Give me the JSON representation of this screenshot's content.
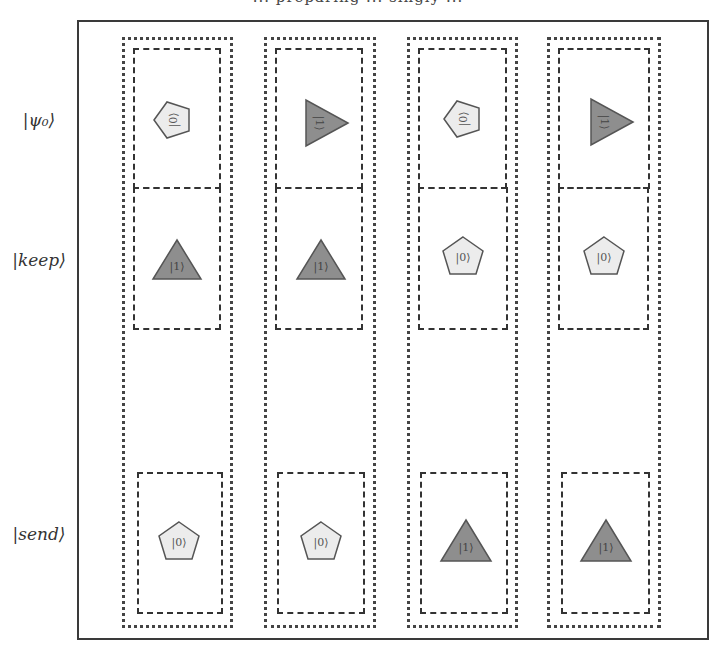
{
  "title": "... preparing ... singly ...",
  "row_labels": {
    "psi0": "|ψ₀⟩",
    "keep": "|keep⟩",
    "send": "|send⟩"
  },
  "colors": {
    "light_fill": "#ececec",
    "dark_fill": "#8e8e8e",
    "stroke": "#555555",
    "frame": "#3a3a3a"
  },
  "columns": [
    {
      "index": 1,
      "psi0": {
        "shape": "pentagon",
        "label": "|0⟩",
        "rotated": true
      },
      "keep": {
        "shape": "triangle",
        "label": "|1⟩",
        "rotated": false
      },
      "send": {
        "shape": "pentagon",
        "label": "|0⟩",
        "rotated": false
      }
    },
    {
      "index": 2,
      "psi0": {
        "shape": "triangle",
        "label": "|1⟩",
        "rotated": true
      },
      "keep": {
        "shape": "triangle",
        "label": "|1⟩",
        "rotated": false
      },
      "send": {
        "shape": "pentagon",
        "label": "|0⟩",
        "rotated": false
      }
    },
    {
      "index": 3,
      "psi0": {
        "shape": "pentagon",
        "label": "|0⟩",
        "rotated": true
      },
      "keep": {
        "shape": "pentagon",
        "label": "|0⟩",
        "rotated": false
      },
      "send": {
        "shape": "triangle",
        "label": "|1⟩",
        "rotated": false
      }
    },
    {
      "index": 4,
      "psi0": {
        "shape": "triangle",
        "label": "|1⟩",
        "rotated": true
      },
      "keep": {
        "shape": "pentagon",
        "label": "|0⟩",
        "rotated": false
      },
      "send": {
        "shape": "triangle",
        "label": "|1⟩",
        "rotated": false
      }
    }
  ]
}
